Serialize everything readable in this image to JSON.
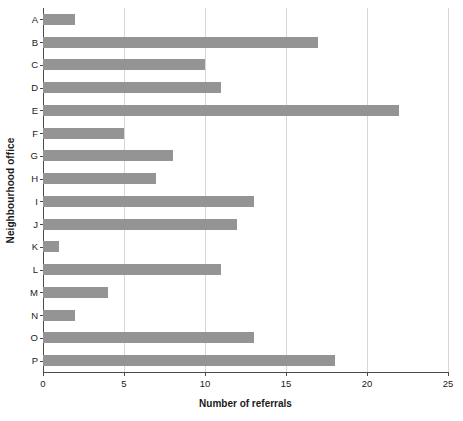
{
  "chart_data": {
    "type": "bar",
    "orientation": "horizontal",
    "title": "",
    "xlabel": "Number of referrals",
    "ylabel": "Neighbourhood office",
    "categories": [
      "A",
      "B",
      "C",
      "D",
      "E",
      "F",
      "G",
      "H",
      "I",
      "J",
      "K",
      "L",
      "M",
      "N",
      "O",
      "P"
    ],
    "values": [
      2,
      17,
      10,
      11,
      22,
      5,
      8,
      7,
      13,
      12,
      1,
      11,
      4,
      2,
      13,
      18
    ],
    "xlim": [
      0,
      25
    ],
    "xticks": [
      0,
      5,
      10,
      15,
      20,
      25
    ],
    "xtick_labels": [
      "0",
      "5",
      "10",
      "15",
      "20",
      "25"
    ],
    "grid": "vertical",
    "legend": "none",
    "bar_color": "#949494",
    "grid_color": "#d6d6d6",
    "axis_color": "#4a4a4a",
    "text_color": "#1a1a1a",
    "background": "#ffffff"
  }
}
